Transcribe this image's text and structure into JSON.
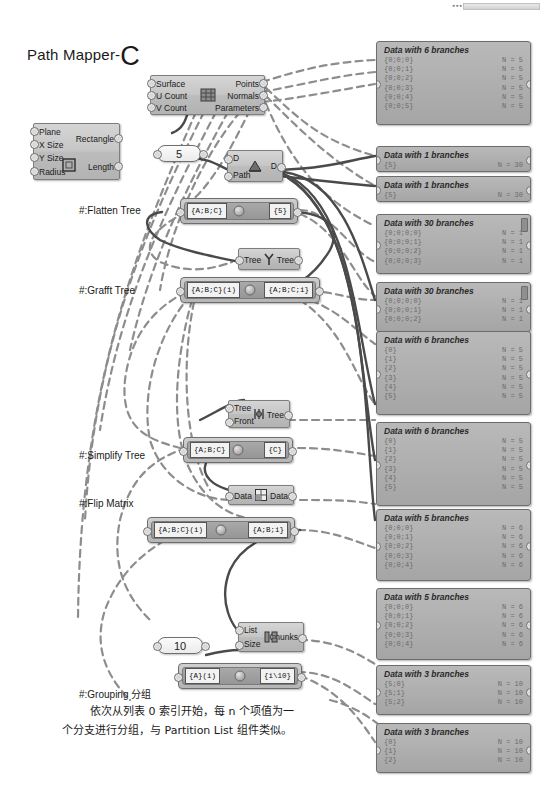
{
  "title": {
    "text": "Path Mapper-",
    "emphasis": "C"
  },
  "components": {
    "rectangle": {
      "name": "rectangle-component",
      "inputs": [
        "Plane",
        "X Size",
        "Y Size",
        "Radius"
      ],
      "outputs": [
        "Rectangle",
        "Length"
      ],
      "icon": "rectangle-icon"
    },
    "divide_surface": {
      "name": "divide-surface-component",
      "inputs": [
        "Surface",
        "U Count",
        "V Count"
      ],
      "outputs": [
        "Points",
        "Normals",
        "Parameters"
      ],
      "icon": "divide-surface-icon"
    },
    "flatten_tree": {
      "name": "flatten-tree-component",
      "inputs": [
        "D",
        "Path"
      ],
      "outputs": [
        "D"
      ],
      "icon": "flatten-tree-icon"
    },
    "graft_tree": {
      "name": "graft-tree-component",
      "inputs": [
        "Tree"
      ],
      "outputs": [
        "Tree"
      ],
      "icon": "graft-tree-icon"
    },
    "simplify_tree": {
      "name": "simplify-tree-component",
      "inputs": [
        "Tree",
        "Front"
      ],
      "outputs": [
        "Tree"
      ],
      "icon": "simplify-tree-icon"
    },
    "flip_matrix": {
      "name": "flip-matrix-component",
      "inputs": [
        "Data"
      ],
      "outputs": [
        "Data"
      ],
      "icon": "flip-matrix-icon"
    },
    "partition": {
      "name": "partition-list-component",
      "inputs": [
        "List",
        "Size"
      ],
      "outputs": [
        "Chunks"
      ],
      "icon": "partition-icon"
    }
  },
  "sliders": [
    {
      "name": "slider-5",
      "value": "5"
    },
    {
      "name": "slider-10",
      "value": "10"
    }
  ],
  "mappers": [
    {
      "name": "mapper-flatten",
      "source": "{A;B;C}",
      "target": "{5}"
    },
    {
      "name": "mapper-graft",
      "source": "{A;B;C}(i)",
      "target": "{A;B;C;i}"
    },
    {
      "name": "mapper-simplify",
      "source": "{A;B;C}",
      "target": "{C}"
    },
    {
      "name": "mapper-flip",
      "source": "{A;B;C}(i)",
      "target": "{A;B;i}"
    },
    {
      "name": "mapper-grouping",
      "source": "{A}(i)",
      "target": "{i\\10}"
    }
  ],
  "labels": [
    {
      "name": "label-flatten-tree",
      "text": "#:Flatten Tree"
    },
    {
      "name": "label-grafft-tree",
      "text": "#:Grafft Tree"
    },
    {
      "name": "label-simplify-tree",
      "text": "#:Simplify Tree"
    },
    {
      "name": "label-flip-matrix",
      "text": "#:Flip Matrix"
    },
    {
      "name": "label-grouping",
      "text": "#:Grouping 分组"
    }
  ],
  "note": {
    "line1": "依次从列表 0 索引开始，每 n 个项值为一",
    "line2": "个分支进行分组，与 Partition List 组件类似。"
  },
  "panels": [
    {
      "name": "panel-divide-output",
      "header": "Data with 6 branches",
      "scroll": false,
      "rows": [
        {
          "path": "{0;0;0}",
          "count": "N = 5"
        },
        {
          "path": "{0;0;1}",
          "count": "N = 5"
        },
        {
          "path": "{0;0;2}",
          "count": "N = 5"
        },
        {
          "path": "{0;0;3}",
          "count": "N = 5"
        },
        {
          "path": "{0;0;4}",
          "count": "N = 5"
        },
        {
          "path": "{0;0;5}",
          "count": "N = 5"
        }
      ]
    },
    {
      "name": "panel-flatten-a",
      "header": "Data with 1 branches",
      "scroll": false,
      "rows": [
        {
          "path": "{5}",
          "count": "N = 30"
        }
      ]
    },
    {
      "name": "panel-flatten-b",
      "header": "Data with 1 branches",
      "scroll": false,
      "rows": [
        {
          "path": "{5}",
          "count": "N = 30"
        }
      ]
    },
    {
      "name": "panel-graft-a",
      "header": "Data with 30 branches",
      "scroll": true,
      "rows": [
        {
          "path": "{0;0;0;0}",
          "count": "N = 1"
        },
        {
          "path": "{0;0;0;1}",
          "count": "N = 1"
        },
        {
          "path": "{0;0;0;2}",
          "count": "N = 1"
        },
        {
          "path": "{0;0;0;3}",
          "count": "N = 1"
        }
      ]
    },
    {
      "name": "panel-graft-b",
      "header": "Data with 30 branches",
      "scroll": true,
      "rows": [
        {
          "path": "{0;0;0;0}",
          "count": "N = 1"
        },
        {
          "path": "{0;0;0;1}",
          "count": "N = 1"
        },
        {
          "path": "{0;0;0;2}",
          "count": "N = 1"
        }
      ]
    },
    {
      "name": "panel-simplify-a",
      "header": "Data with 6 branches",
      "scroll": false,
      "rows": [
        {
          "path": "{0}",
          "count": "N = 5"
        },
        {
          "path": "{1}",
          "count": "N = 5"
        },
        {
          "path": "{2}",
          "count": "N = 5"
        },
        {
          "path": "{3}",
          "count": "N = 5"
        },
        {
          "path": "{4}",
          "count": "N = 5"
        },
        {
          "path": "{5}",
          "count": "N = 5"
        }
      ]
    },
    {
      "name": "panel-simplify-b",
      "header": "Data with 6 branches",
      "scroll": false,
      "rows": [
        {
          "path": "{0}",
          "count": "N = 5"
        },
        {
          "path": "{1}",
          "count": "N = 5"
        },
        {
          "path": "{2}",
          "count": "N = 5"
        },
        {
          "path": "{3}",
          "count": "N = 5"
        },
        {
          "path": "{4}",
          "count": "N = 5"
        },
        {
          "path": "{5}",
          "count": "N = 5"
        }
      ]
    },
    {
      "name": "panel-flip-a",
      "header": "Data with 5 branches",
      "scroll": false,
      "rows": [
        {
          "path": "{0;0;0}",
          "count": "N = 6"
        },
        {
          "path": "{0;0;1}",
          "count": "N = 6"
        },
        {
          "path": "{0;0;2}",
          "count": "N = 6"
        },
        {
          "path": "{0;0;3}",
          "count": "N = 6"
        },
        {
          "path": "{0;0;4}",
          "count": "N = 6"
        }
      ]
    },
    {
      "name": "panel-flip-b",
      "header": "Data with 5 branches",
      "scroll": false,
      "rows": [
        {
          "path": "{0;0;0}",
          "count": "N = 6"
        },
        {
          "path": "{0;0;1}",
          "count": "N = 6"
        },
        {
          "path": "{0;0;2}",
          "count": "N = 6"
        },
        {
          "path": "{0;0;3}",
          "count": "N = 6"
        },
        {
          "path": "{0;0;4}",
          "count": "N = 6"
        }
      ]
    },
    {
      "name": "panel-group-a",
      "header": "Data with 3 branches",
      "scroll": false,
      "rows": [
        {
          "path": "{5;0}",
          "count": "N = 10"
        },
        {
          "path": "{5;1}",
          "count": "N = 10"
        },
        {
          "path": "{5;2}",
          "count": "N = 10"
        }
      ]
    },
    {
      "name": "panel-group-b",
      "header": "Data with 3 branches",
      "scroll": false,
      "rows": [
        {
          "path": "{0}",
          "count": "N = 10"
        },
        {
          "path": "{1}",
          "count": "N = 10"
        },
        {
          "path": "{2}",
          "count": "N = 10"
        }
      ]
    }
  ],
  "colors": {
    "wire": "#585858",
    "dashed_wire": "#8a8a8a",
    "component": "#bdbdbd",
    "panel": "#ababab"
  }
}
